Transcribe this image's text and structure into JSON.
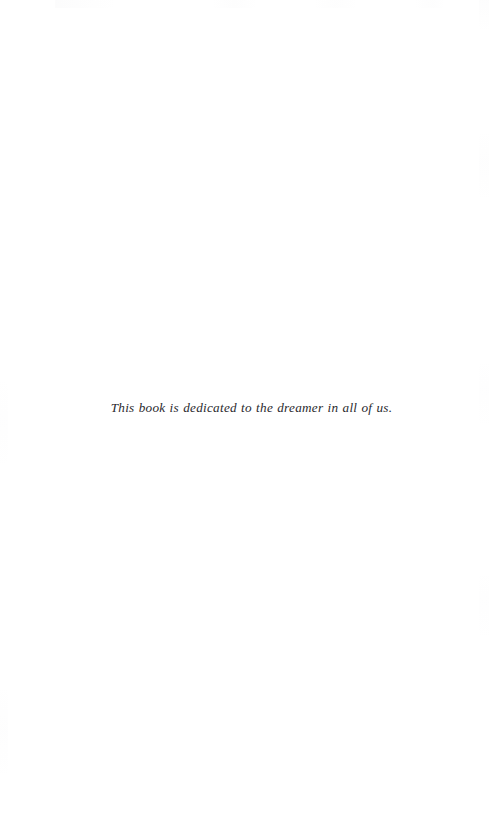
{
  "page": {
    "kind": "book-dedication-page",
    "width": 489,
    "height": 813,
    "background_color": "#ffffff",
    "ink_color": "#2a2a2e"
  },
  "dedication": {
    "text": "This book is dedicated to the dreamer in all of us.",
    "style": "italic-serif",
    "alignment": "center"
  }
}
